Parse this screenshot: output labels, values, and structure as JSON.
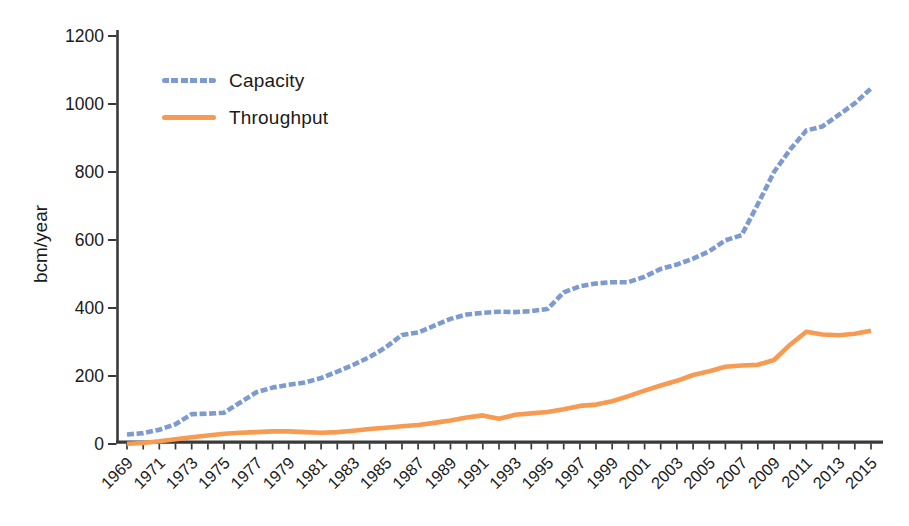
{
  "chart_data": {
    "type": "line",
    "title": "",
    "xlabel": "",
    "ylabel": "bcm/year",
    "ylim": [
      0,
      1200
    ],
    "yticks": [
      0,
      200,
      400,
      600,
      800,
      1000,
      1200
    ],
    "x_label_every": 2,
    "grid": false,
    "legend_position": "upper-left-inside",
    "axis_color": "#3a3a3a",
    "text_color": "#1a1a1a",
    "x": [
      1969,
      1970,
      1971,
      1972,
      1973,
      1974,
      1975,
      1976,
      1977,
      1978,
      1979,
      1980,
      1981,
      1982,
      1983,
      1984,
      1985,
      1986,
      1987,
      1988,
      1989,
      1990,
      1991,
      1992,
      1993,
      1994,
      1995,
      1996,
      1997,
      1998,
      1999,
      2000,
      2001,
      2002,
      2003,
      2004,
      2005,
      2006,
      2007,
      2008,
      2009,
      2010,
      2011,
      2012,
      2013,
      2014,
      2015
    ],
    "series": [
      {
        "name": "Capacity",
        "color": "#7e9bd0",
        "style": "dashed",
        "values": [
          28,
          32,
          42,
          58,
          88,
          89,
          92,
          122,
          152,
          166,
          174,
          181,
          194,
          213,
          233,
          256,
          284,
          321,
          328,
          348,
          368,
          381,
          386,
          389,
          388,
          391,
          397,
          446,
          464,
          472,
          476,
          476,
          492,
          515,
          528,
          545,
          567,
          599,
          614,
          705,
          800,
          866,
          922,
          934,
          968,
          1002,
          1046
        ]
      },
      {
        "name": "Throughput",
        "color": "#f79a52",
        "style": "solid",
        "values": [
          1,
          3,
          8,
          14,
          20,
          25,
          30,
          33,
          35,
          37,
          37,
          35,
          33,
          35,
          39,
          44,
          48,
          52,
          56,
          62,
          69,
          78,
          84,
          74,
          86,
          90,
          94,
          102,
          112,
          116,
          126,
          141,
          157,
          172,
          186,
          203,
          214,
          227,
          231,
          233,
          247,
          292,
          330,
          322,
          320,
          324,
          333
        ]
      }
    ]
  }
}
